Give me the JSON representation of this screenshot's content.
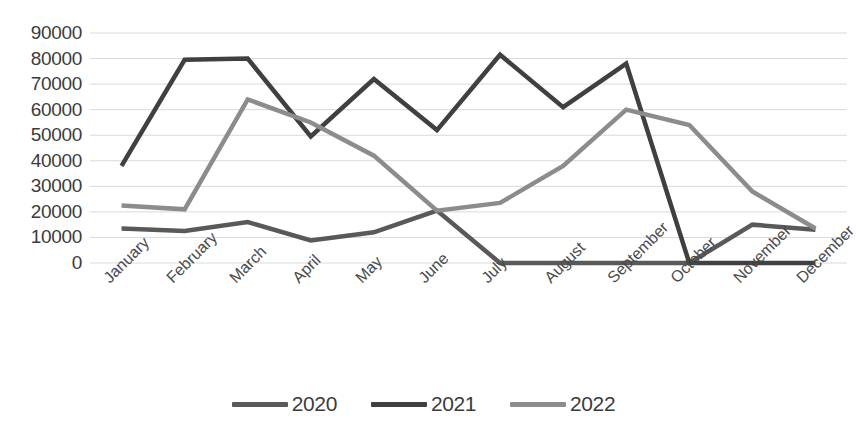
{
  "chart_data": {
    "type": "line",
    "title": "",
    "xlabel": "",
    "ylabel": "",
    "categories": [
      "January",
      "February",
      "March",
      "April",
      "May",
      "June",
      "July",
      "August",
      "September",
      "October",
      "November",
      "December"
    ],
    "ylim": [
      0,
      90000
    ],
    "ytick_labels": [
      "90000",
      "80000",
      "70000",
      "60000",
      "50000",
      "40000",
      "30000",
      "20000",
      "10000",
      "0"
    ],
    "ytick_values": [
      90000,
      80000,
      70000,
      60000,
      50000,
      40000,
      30000,
      20000,
      10000,
      0
    ],
    "ytick_step": 10000,
    "grid": true,
    "grid_axis": "y",
    "legend_position": "bottom",
    "series": [
      {
        "name": "2020",
        "color": "#595959",
        "values": [
          13500,
          12500,
          16000,
          8800,
          12000,
          20500,
          0,
          0,
          0,
          0,
          15000,
          13000
        ]
      },
      {
        "name": "2021",
        "color": "#404040",
        "values": [
          38000,
          79500,
          80000,
          49500,
          72000,
          52000,
          81500,
          61000,
          78000,
          0,
          0,
          0
        ]
      },
      {
        "name": "2022",
        "color": "#8c8c8c",
        "values": [
          22500,
          21000,
          64000,
          55000,
          42000,
          20500,
          23500,
          38000,
          60000,
          54000,
          28000,
          13500
        ]
      }
    ]
  },
  "axis": {
    "gridline_color": "#d9d9d9",
    "tick_text_color": "#3b3b3b"
  }
}
